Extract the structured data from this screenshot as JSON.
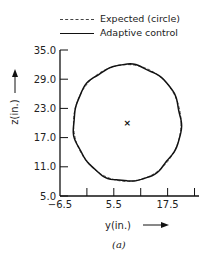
{
  "chart_data": {
    "type": "line",
    "title": "",
    "caption": "(a)",
    "xlabel": "y(in.)",
    "ylabel": "z(in.)",
    "xlim": [
      -6.5,
      24.5
    ],
    "ylim": [
      5.0,
      35.0
    ],
    "x_ticks": [
      -6.5,
      -0.5,
      5.5,
      11.5,
      17.5,
      23.5
    ],
    "x_tick_labels": [
      "-6.5",
      "",
      "5.5",
      "",
      "17.5",
      ""
    ],
    "y_ticks": [
      35.0,
      29.0,
      23.0,
      17.0,
      11.0,
      5.0
    ],
    "y_tick_labels": [
      "35.0",
      "29.0",
      "23.0",
      "17.0",
      "11.0",
      "5.0"
    ],
    "grid": false,
    "legend_position": "top",
    "center_marker": {
      "y": 8.5,
      "z": 20.0,
      "symbol": "x"
    },
    "series": [
      {
        "name": "Expected (circle)",
        "style": "dashed",
        "center": [
          8.5,
          20.0
        ],
        "radius": 12.0
      },
      {
        "name": "Adaptive control",
        "style": "solid",
        "center": [
          8.5,
          20.0
        ],
        "radius": 12.0,
        "note": "closely tracks expected circle with small deviations"
      }
    ]
  },
  "legend": {
    "items": [
      {
        "label": "Expected (circle)"
      },
      {
        "label": "Adaptive control"
      }
    ]
  }
}
